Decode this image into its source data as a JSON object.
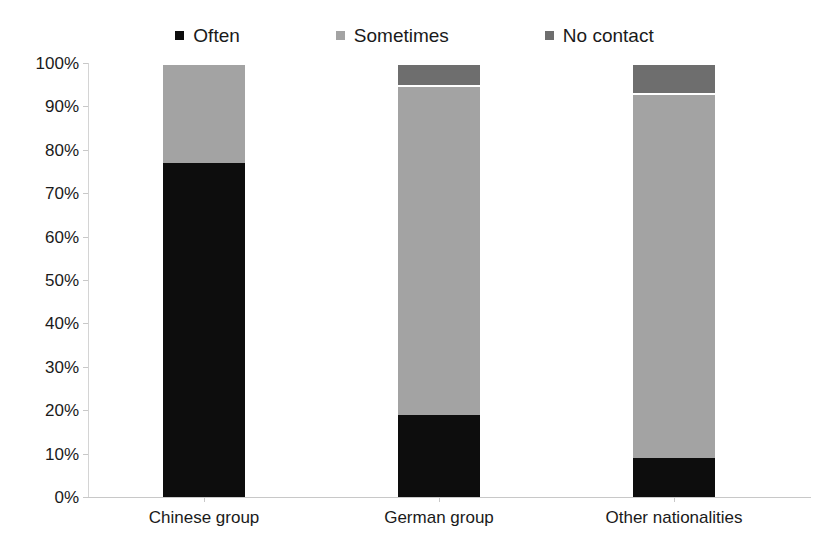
{
  "chart_data": {
    "type": "bar",
    "stacked": true,
    "stack_total": 100,
    "title": "",
    "xlabel": "",
    "ylabel": "",
    "ylim": [
      0,
      100
    ],
    "ytick_labels": [
      "0%",
      "10%",
      "20%",
      "30%",
      "40%",
      "50%",
      "60%",
      "70%",
      "80%",
      "90%",
      "100%"
    ],
    "ytick_values": [
      0,
      10,
      20,
      30,
      40,
      50,
      60,
      70,
      80,
      90,
      100
    ],
    "grid": false,
    "legend_position": "top-center",
    "categories": [
      "Chinese group",
      "German group",
      "Other nationalities"
    ],
    "series": [
      {
        "name": "Often",
        "color": "#0d0d0d",
        "values": [
          77,
          19,
          9
        ]
      },
      {
        "name": "Sometimes",
        "color": "#a3a3a3",
        "values": [
          23,
          76,
          84
        ]
      },
      {
        "name": "No contact",
        "color": "#6e6e6e",
        "values": [
          0,
          5,
          7
        ]
      }
    ]
  },
  "legend": {
    "items": [
      {
        "label": "Often",
        "color": "#0d0d0d"
      },
      {
        "label": "Sometimes",
        "color": "#a3a3a3"
      },
      {
        "label": "No contact",
        "color": "#6e6e6e"
      }
    ]
  }
}
